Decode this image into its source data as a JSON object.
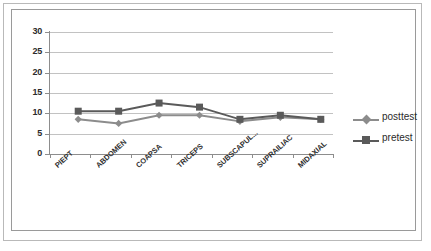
{
  "chart_data": {
    "type": "line",
    "title": "",
    "xlabel": "",
    "ylabel": "",
    "categories": [
      "PIEPT",
      "ABDOMEN",
      "COAPSA",
      "TRICEPS",
      "SUBSCAPUL...",
      "SUPRAILIAC",
      "MIDAXIAL"
    ],
    "series": [
      {
        "name": "posttest",
        "values": [
          10,
          9,
          11,
          11,
          9.5,
          10.5,
          10
        ],
        "color": "#8c8c8c",
        "marker": "diamond"
      },
      {
        "name": "pretest",
        "values": [
          12,
          12,
          14,
          13,
          10,
          11,
          10
        ],
        "color": "#5a5a5a",
        "marker": "square"
      }
    ],
    "ylim": [
      0,
      30
    ],
    "yticks": [
      0,
      5,
      10,
      15,
      20,
      25,
      30
    ],
    "ytick_labels": [
      "0",
      "5",
      "10",
      "15",
      "20",
      "25",
      "30"
    ],
    "grid": true,
    "grid_axis": "y",
    "legend_position": "right"
  },
  "legend": {
    "entries": [
      {
        "label": "posttest"
      },
      {
        "label": "pretest"
      }
    ]
  },
  "colors": {
    "posttest": "#8c8c8c",
    "pretest": "#5a5a5a",
    "gridline": "#c2c2c2",
    "axis": "#8d8d8d",
    "text": "#2b2b2b",
    "frame_outer": "#b9b9b9",
    "frame_inner": "#9a9a9a",
    "background": "#ffffff"
  }
}
